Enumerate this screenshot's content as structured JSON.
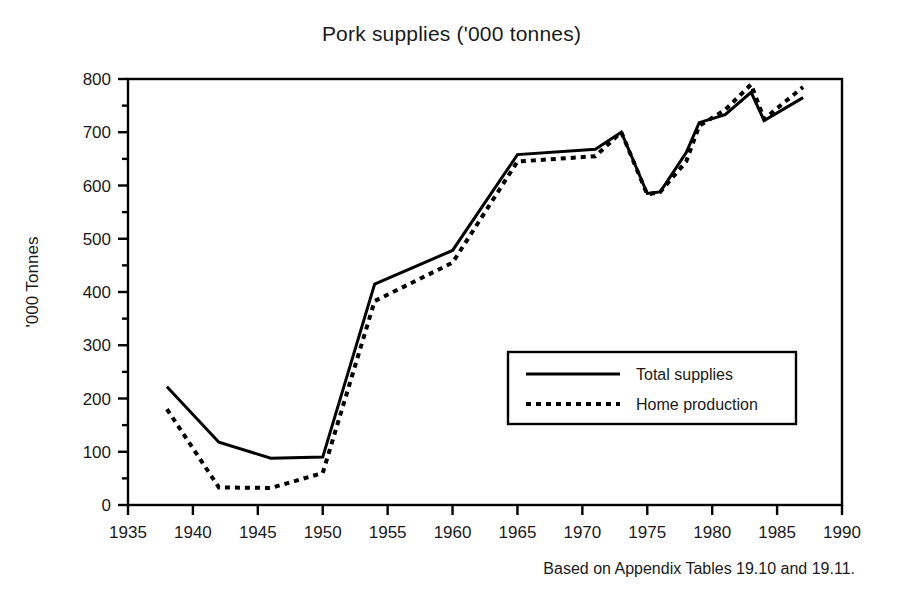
{
  "figure": {
    "title": "Pork supplies ('000 tonnes)",
    "y_axis_title": "'000 Tonnes",
    "footnote": "Based on Appendix Tables 19.10 and 19.11."
  },
  "chart_data": {
    "type": "line",
    "title": "Pork supplies ('000 tonnes)",
    "xlabel": "",
    "ylabel": "'000 Tonnes",
    "xlim": [
      1935,
      1990
    ],
    "ylim": [
      0,
      800
    ],
    "xticks": [
      1935,
      1940,
      1945,
      1950,
      1955,
      1960,
      1965,
      1970,
      1975,
      1980,
      1985,
      1990
    ],
    "yticks": [
      0,
      100,
      200,
      300,
      400,
      500,
      600,
      700,
      800
    ],
    "y_minor_tick_step": 50,
    "grid": false,
    "legend_position": "center-right",
    "series": [
      {
        "name": "Total supplies",
        "style": "solid",
        "color": "#000000",
        "x": [
          1938,
          1942,
          1946,
          1950,
          1954,
          1960,
          1965,
          1971,
          1973,
          1975,
          1976,
          1978,
          1979,
          1981,
          1983,
          1984,
          1987
        ],
        "values": [
          222,
          118,
          88,
          90,
          415,
          478,
          658,
          668,
          700,
          585,
          588,
          662,
          718,
          733,
          775,
          722,
          765
        ]
      },
      {
        "name": "Home production",
        "style": "dotted",
        "color": "#000000",
        "x": [
          1938,
          1942,
          1946,
          1950,
          1954,
          1960,
          1965,
          1971,
          1973,
          1975,
          1976,
          1978,
          1979,
          1981,
          1983,
          1984,
          1987
        ],
        "values": [
          180,
          33,
          32,
          60,
          383,
          455,
          645,
          655,
          700,
          583,
          588,
          645,
          712,
          742,
          790,
          725,
          785
        ]
      }
    ]
  },
  "legend": {
    "items": [
      {
        "label": "Total supplies",
        "style": "solid"
      },
      {
        "label": "Home production",
        "style": "dotted"
      }
    ]
  },
  "axis": {
    "x_tick_labels": [
      "1935",
      "1940",
      "1945",
      "1950",
      "1955",
      "1960",
      "1965",
      "1970",
      "1975",
      "1980",
      "1985",
      "1990"
    ],
    "y_tick_labels": [
      "0",
      "100",
      "200",
      "300",
      "400",
      "500",
      "600",
      "700",
      "800"
    ]
  }
}
